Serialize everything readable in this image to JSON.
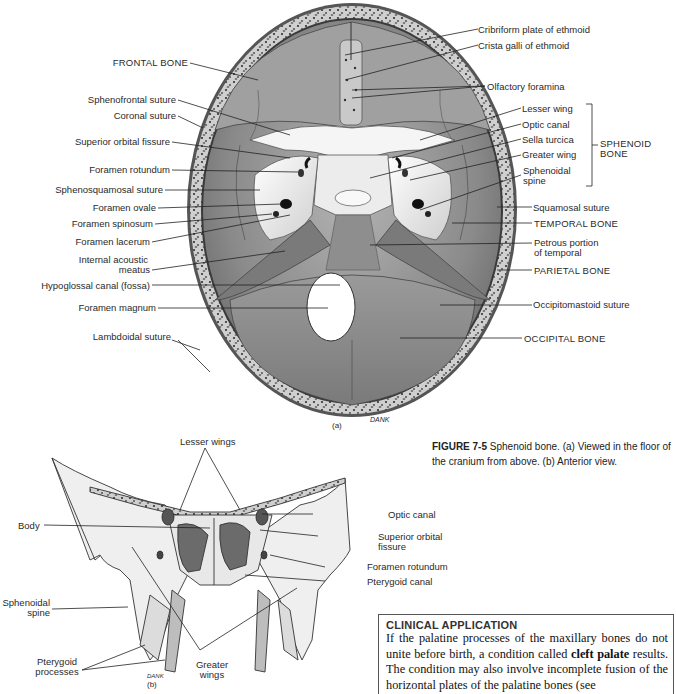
{
  "figure_a": {
    "panel_label": "(a)",
    "signature": "DANK",
    "left_labels": [
      {
        "id": "frontal-bone",
        "text": "FRONTAL BONE"
      },
      {
        "id": "sphenofrontal-suture",
        "text": "Sphenofrontal suture"
      },
      {
        "id": "coronal-suture",
        "text": "Coronal suture"
      },
      {
        "id": "superior-orbital-fissure",
        "text": "Superior orbital fissure"
      },
      {
        "id": "foramen-rotundum",
        "text": "Foramen rotundum"
      },
      {
        "id": "sphenosquamosal-suture",
        "text": "Sphenosquamosal suture"
      },
      {
        "id": "foramen-ovale",
        "text": "Foramen ovale"
      },
      {
        "id": "foramen-spinosum",
        "text": "Foramen spinosum"
      },
      {
        "id": "foramen-lacerum",
        "text": "Foramen lacerum"
      },
      {
        "id": "internal-acoustic-meatus-1",
        "text": "Internal acoustic"
      },
      {
        "id": "internal-acoustic-meatus-2",
        "text": "meatus"
      },
      {
        "id": "hypoglossal-canal",
        "text": "Hypoglossal canal (fossa)"
      },
      {
        "id": "foramen-magnum",
        "text": "Foramen magnum"
      },
      {
        "id": "lambdoidal-suture",
        "text": "Lambdoidal suture"
      }
    ],
    "right_labels": [
      {
        "id": "cribriform-plate",
        "text": "Cribriform plate of ethmoid"
      },
      {
        "id": "crista-galli",
        "text": "Crista galli of ethmoid"
      },
      {
        "id": "olfactory-foramina",
        "text": "Olfactory foramina"
      },
      {
        "id": "lesser-wing",
        "text": "Lesser wing"
      },
      {
        "id": "optic-canal",
        "text": "Optic canal"
      },
      {
        "id": "sella-turcica",
        "text": "Sella turcica"
      },
      {
        "id": "greater-wing",
        "text": "Greater wing"
      },
      {
        "id": "sphenoidal-spine-1",
        "text": "Sphenoidal"
      },
      {
        "id": "sphenoidal-spine-2",
        "text": "spine"
      },
      {
        "id": "squamosal-suture",
        "text": "Squamosal suture"
      },
      {
        "id": "temporal-bone",
        "text": "TEMPORAL BONE"
      },
      {
        "id": "petrous-portion-1",
        "text": "Petrous portion"
      },
      {
        "id": "petrous-portion-2",
        "text": "of temporal"
      },
      {
        "id": "parietal-bone",
        "text": "PARIETAL BONE"
      },
      {
        "id": "occipitomastoid-suture",
        "text": "Occipitomastoid suture"
      },
      {
        "id": "occipital-bone",
        "text": "OCCIPITAL BONE"
      }
    ],
    "bracket_label": [
      "SPHENOID",
      "BONE"
    ]
  },
  "figure_b": {
    "panel_label": "(b)",
    "signature": "DANK",
    "labels": {
      "lesser_wings": "Lesser wings",
      "body": "Body",
      "optic_canal": "Optic canal",
      "superior_orbital_fissure_1": "Superior orbital",
      "superior_orbital_fissure_2": "fissure",
      "foramen_rotundum": "Foramen rotundum",
      "pterygoid_canal": "Pterygoid canal",
      "sphenoidal_spine_1": "Sphenoidal",
      "sphenoidal_spine_2": "spine",
      "pterygoid_processes_1": "Pterygoid",
      "pterygoid_processes_2": "processes",
      "greater_wings_1": "Greater",
      "greater_wings_2": "wings"
    }
  },
  "caption": {
    "figure_number": "FIGURE 7-5",
    "text": "Sphenoid bone. (a) Viewed in the floor of the cranium from above. (b) Anterior view."
  },
  "clinical_application": {
    "heading": "CLINICAL APPLICATION",
    "text_before": "If the palatine processes of the maxillary bones do not unite before birth, a condition called ",
    "bold_term": "cleft palate",
    "text_after": " results. The condition may also involve incomplete fusion of the horizontal plates of the palatine bones (see"
  },
  "colors": {
    "bone_gray": "#8c8c8c",
    "bone_dark": "#5e5e5e",
    "bone_light": "#d8d8d8",
    "sphenoid_white": "#f2f2f2",
    "ink": "#222222"
  }
}
